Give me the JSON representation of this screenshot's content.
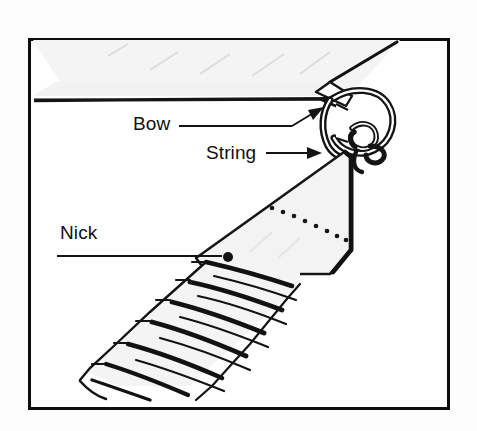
{
  "figure": {
    "kind": "line-drawing",
    "border_color": "#0d0d0d",
    "background_color": "#ffffff",
    "page_background_color": "#fdfdfd",
    "ink_color": "#111111",
    "shade_color": "#e9e9e9"
  },
  "labels": {
    "bow": "Bow",
    "string": "String",
    "nick": "Nick"
  },
  "parts": {
    "bow_limb_name": "bow-limb",
    "bow_string_name": "bow-string",
    "nocking_knot_name": "nocking-knot",
    "arrow_nock_name": "arrow-nock",
    "fletching_name": "fletching",
    "dotted_seam_name": "dotted-seam"
  },
  "leaders": {
    "bow": {
      "type": "arrow",
      "direction": "right"
    },
    "string": {
      "type": "arrow",
      "direction": "right"
    },
    "nick": {
      "type": "dot",
      "direction": "right"
    }
  }
}
